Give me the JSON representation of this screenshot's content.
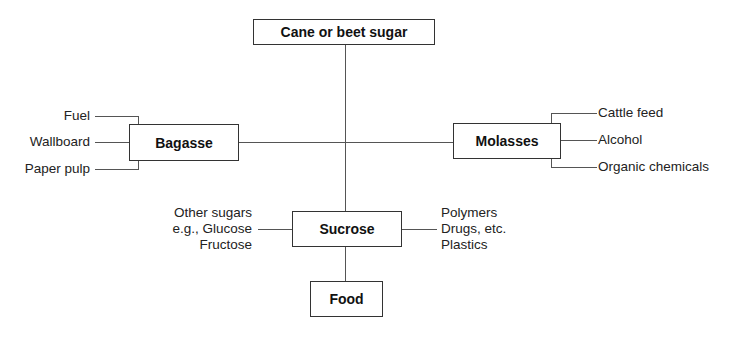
{
  "diagram": {
    "title_node": "Cane or beet sugar",
    "nodes": {
      "bagasse": "Bagasse",
      "molasses": "Molasses",
      "sucrose": "Sucrose",
      "food": "Food"
    },
    "bagasse_outputs": [
      "Fuel",
      "Wallboard",
      "Paper pulp"
    ],
    "molasses_outputs": [
      "Cattle feed",
      "Alcohol",
      "Organic chemicals"
    ],
    "sucrose_left": [
      "Other sugars",
      "e.g., Glucose",
      "Fructose"
    ],
    "sucrose_right": [
      "Polymers",
      "Drugs, etc.",
      "Plastics"
    ]
  }
}
